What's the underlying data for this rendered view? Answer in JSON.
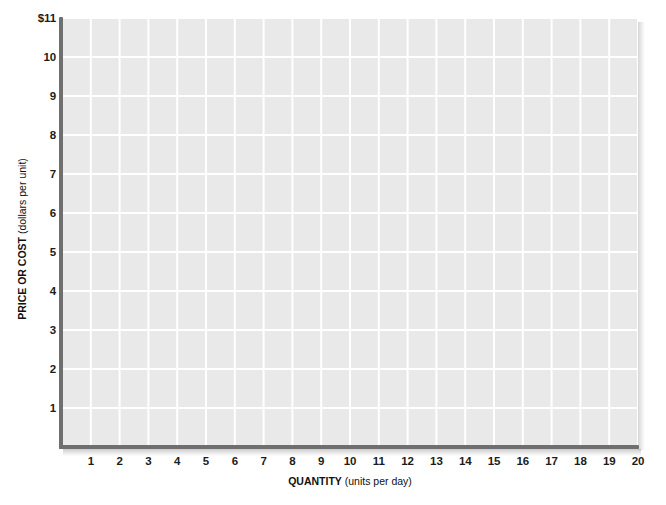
{
  "chart_data": {
    "type": "line",
    "title": "",
    "subtitle": "",
    "xlabel_bold": "QUANTITY",
    "xlabel_light": "(units per day)",
    "ylabel_bold": "PRICE OR COST",
    "ylabel_light": "(dollars per unit)",
    "xlim": [
      0,
      20
    ],
    "ylim": [
      0,
      11
    ],
    "x_ticks": [
      1,
      2,
      3,
      4,
      5,
      6,
      7,
      8,
      9,
      10,
      11,
      12,
      13,
      14,
      15,
      16,
      17,
      18,
      19,
      20
    ],
    "x_tick_labels": [
      "1",
      "2",
      "3",
      "4",
      "5",
      "6",
      "7",
      "8",
      "9",
      "10",
      "11",
      "12",
      "13",
      "14",
      "15",
      "16",
      "17",
      "18",
      "19",
      "20"
    ],
    "y_ticks": [
      1,
      2,
      3,
      4,
      5,
      6,
      7,
      8,
      9,
      10,
      11
    ],
    "y_tick_labels": [
      "1",
      "2",
      "3",
      "4",
      "5",
      "6",
      "7",
      "8",
      "9",
      "10",
      "$11"
    ],
    "grid": true,
    "grid_color": "#ffffff",
    "plot_background": "#e9e9e9",
    "axis_color": "#6f6f6f",
    "series": [],
    "values": [],
    "categories": [],
    "legend": [],
    "legend_position": "none",
    "annotations": [],
    "note": "Blank graph grid template with no plotted data series."
  },
  "figure": {
    "bottom_caption": ""
  }
}
